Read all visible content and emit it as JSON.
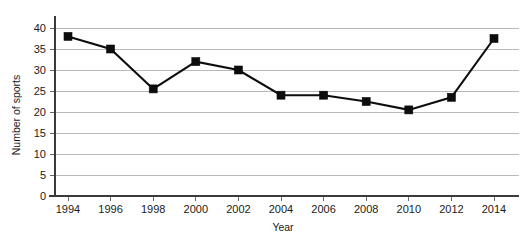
{
  "chart_data": {
    "type": "line",
    "title": "",
    "subtitle": "",
    "xlabel": "Year",
    "ylabel": "Number of sports",
    "categories": [
      "1994",
      "1996",
      "1998",
      "2000",
      "2002",
      "2004",
      "2006",
      "2008",
      "2010",
      "2012",
      "2014"
    ],
    "values": [
      38,
      35,
      25.5,
      32,
      30,
      24,
      24,
      22.5,
      20.5,
      23.5,
      37.5
    ],
    "series": [
      {
        "name": "Number of sports",
        "values": [
          38,
          35,
          25.5,
          32,
          30,
          24,
          24,
          22.5,
          20.5,
          23.5,
          37.5
        ]
      }
    ],
    "ylim": [
      0,
      40
    ],
    "yticks": [
      0,
      5,
      10,
      15,
      20,
      25,
      30,
      35,
      40
    ],
    "ytick_labels": [
      "0",
      "5",
      "10",
      "15",
      "20",
      "25",
      "30",
      "35",
      "40"
    ],
    "xtick_labels": [
      "1994",
      "1996",
      "1998",
      "2000",
      "2002",
      "2004",
      "2006",
      "2008",
      "2010",
      "2012",
      "2014"
    ],
    "grid": "horizontal",
    "legend": "none",
    "marker": "square",
    "colors": {
      "line": "#0d0d0d",
      "marker": "#0d0d0d",
      "gridline": "#b9b9b9",
      "axis": "#3a3a3a",
      "background": "#ffffff",
      "text": "#1a1a1a"
    }
  },
  "axis": {
    "y_title": "Number of sports",
    "x_title": "Year"
  }
}
